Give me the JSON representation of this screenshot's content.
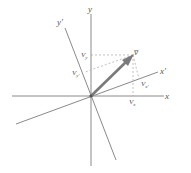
{
  "diagram": {
    "colors": {
      "axis": "#8a8a8a",
      "vector": "#7a7a7a",
      "dashed": "#b0b0b0",
      "label": "#555555"
    },
    "axes": {
      "x": {
        "label": "x"
      },
      "y": {
        "label": "y"
      },
      "x_prime": {
        "label": "x'"
      },
      "y_prime": {
        "label": "y'"
      }
    },
    "vector": {
      "label": "v̅"
    },
    "components": {
      "v_x": {
        "base": "V",
        "sub": "x"
      },
      "v_y": {
        "base": "V",
        "sub": "y"
      },
      "v_x_prime": {
        "base": "V",
        "sub": "x'"
      },
      "v_y_prime": {
        "base": "V",
        "sub": "y'"
      }
    }
  }
}
